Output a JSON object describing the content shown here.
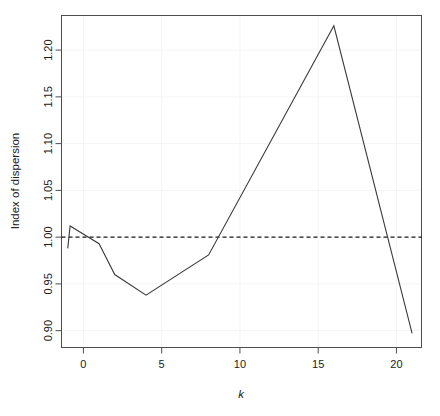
{
  "chart_data": {
    "type": "line",
    "title": "",
    "xlabel": "k",
    "ylabel": "Index of dispersion",
    "xlim": [
      -1.4,
      21.6
    ],
    "ylim": [
      0.882,
      1.237
    ],
    "xticks": [
      0,
      5,
      10,
      15,
      20
    ],
    "xticklabels": [
      "0",
      "5",
      "10",
      "15",
      "20"
    ],
    "yticks": [
      0.9,
      0.95,
      1.0,
      1.05,
      1.1,
      1.15,
      1.2
    ],
    "yticklabels": [
      "0.90",
      "0.95",
      "1.00",
      "1.05",
      "1.10",
      "1.15",
      "1.20"
    ],
    "grid": true,
    "legend": "none",
    "series": [
      {
        "name": "Index of dispersion",
        "style": "solid",
        "color": "#3a3a3a",
        "x": [
          -1.0,
          -0.85,
          1,
          2,
          4,
          8,
          16,
          21
        ],
        "values": [
          0.988,
          1.012,
          0.993,
          0.96,
          0.938,
          0.981,
          1.226,
          0.897
        ]
      },
      {
        "name": "reference",
        "style": "dashed",
        "color": "#1a1a1a",
        "x": [
          -1.4,
          21.6
        ],
        "values": [
          1.0,
          1.0
        ]
      }
    ],
    "annotations": []
  }
}
